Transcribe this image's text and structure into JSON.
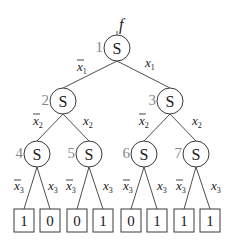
{
  "diagram": {
    "function_label": "f",
    "node_symbol": "S",
    "nodes": [
      {
        "id": "1",
        "symbol": "S"
      },
      {
        "id": "2",
        "symbol": "S"
      },
      {
        "id": "3",
        "symbol": "S"
      },
      {
        "id": "4",
        "symbol": "S"
      },
      {
        "id": "5",
        "symbol": "S"
      },
      {
        "id": "6",
        "symbol": "S"
      },
      {
        "id": "7",
        "symbol": "S"
      }
    ],
    "edges": [
      {
        "from": "1",
        "to": "2",
        "label": "x1",
        "negated": true
      },
      {
        "from": "1",
        "to": "3",
        "label": "x1",
        "negated": false
      },
      {
        "from": "2",
        "to": "4",
        "label": "x2",
        "negated": true
      },
      {
        "from": "2",
        "to": "5",
        "label": "x2",
        "negated": false
      },
      {
        "from": "3",
        "to": "6",
        "label": "x2",
        "negated": true
      },
      {
        "from": "3",
        "to": "7",
        "label": "x2",
        "negated": false
      },
      {
        "from": "4",
        "to": "leaf0",
        "label": "x3",
        "negated": true
      },
      {
        "from": "4",
        "to": "leaf1",
        "label": "x3",
        "negated": false
      },
      {
        "from": "5",
        "to": "leaf2",
        "label": "x3",
        "negated": true
      },
      {
        "from": "5",
        "to": "leaf3",
        "label": "x3",
        "negated": false
      },
      {
        "from": "6",
        "to": "leaf4",
        "label": "x3",
        "negated": true
      },
      {
        "from": "6",
        "to": "leaf5",
        "label": "x3",
        "negated": false
      },
      {
        "from": "7",
        "to": "leaf6",
        "label": "x3",
        "negated": true
      },
      {
        "from": "7",
        "to": "leaf7",
        "label": "x3",
        "negated": false
      }
    ],
    "edge_labels": {
      "x1": {
        "var": "x",
        "sub": "1"
      },
      "x2": {
        "var": "x",
        "sub": "2"
      },
      "x3": {
        "var": "x",
        "sub": "3"
      }
    },
    "leaves": [
      "1",
      "0",
      "0",
      "1",
      "0",
      "1",
      "1",
      "1"
    ]
  }
}
